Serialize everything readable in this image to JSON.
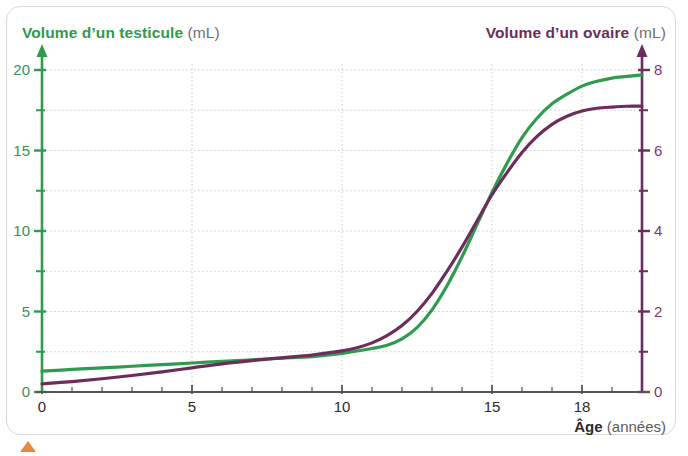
{
  "figure": {
    "frame_color": "#d9d9d9",
    "background": "#ffffff",
    "marker_color": "#e8883a",
    "marker_name": "orange-triangle-marker"
  },
  "titles": {
    "left_axis_main": "Volume d’un testicule",
    "left_axis_unit": "(mL)",
    "right_axis_main": "Volume d’un ovaire",
    "right_axis_unit": "(mL)",
    "x_axis_main": "Âge",
    "x_axis_unit": "(années)"
  },
  "ticks": {
    "left": [
      "20",
      "15",
      "10",
      "5",
      "0"
    ],
    "right": [
      "8",
      "6",
      "4",
      "2",
      "0"
    ],
    "x": [
      "0",
      "5",
      "10",
      "15",
      "18"
    ]
  },
  "chart_data": {
    "type": "line",
    "title": "",
    "subtitle": "",
    "xlabel": "Âge (années)",
    "ylabel": "Volume d’un testicule (mL)",
    "y2label": "Volume d’un ovaire (mL)",
    "xlim": [
      0,
      20
    ],
    "ylim": [
      0,
      20
    ],
    "y2lim": [
      0,
      8
    ],
    "xticks": [
      0,
      5,
      10,
      15,
      18
    ],
    "xticks_minor_step": 1,
    "yticks": [
      0,
      5,
      10,
      15,
      20
    ],
    "yticks_minor_step": 2.5,
    "y2ticks": [
      0,
      2,
      4,
      6,
      8
    ],
    "y2ticks_minor_step": 1,
    "grid": true,
    "grid_style": "dotted",
    "legend": "axis-colored-titles",
    "legend_position": "none",
    "series": [
      {
        "name": "Volume d’un testicule",
        "axis": "left",
        "unit": "mL",
        "color": "#2e9b4e",
        "x": [
          0,
          1,
          2,
          3,
          4,
          5,
          6,
          7,
          8,
          9,
          10,
          11,
          11.5,
          12,
          12.5,
          13,
          13.5,
          14,
          14.5,
          15,
          15.5,
          16,
          16.5,
          17,
          17.5,
          18,
          18.5,
          19,
          19.5,
          20
        ],
        "values": [
          1.3,
          1.4,
          1.5,
          1.6,
          1.7,
          1.8,
          1.9,
          2.0,
          2.1,
          2.2,
          2.4,
          2.7,
          2.9,
          3.3,
          4.0,
          5.1,
          6.6,
          8.4,
          10.4,
          12.4,
          14.2,
          15.8,
          17.0,
          17.9,
          18.5,
          19.0,
          19.3,
          19.5,
          19.6,
          19.7
        ]
      },
      {
        "name": "Volume d’un ovaire",
        "axis": "right",
        "unit": "mL",
        "color": "#6b2d5c",
        "x": [
          0,
          1,
          2,
          3,
          4,
          5,
          6,
          7,
          8,
          9,
          10,
          10.5,
          11,
          11.5,
          12,
          12.5,
          13,
          13.5,
          14,
          14.5,
          15,
          15.5,
          16,
          16.5,
          17,
          17.5,
          18,
          18.5,
          19,
          19.5,
          20
        ],
        "values": [
          0.2,
          0.26,
          0.33,
          0.41,
          0.5,
          0.6,
          0.7,
          0.78,
          0.85,
          0.92,
          1.02,
          1.1,
          1.22,
          1.4,
          1.65,
          2.0,
          2.45,
          3.0,
          3.6,
          4.25,
          4.9,
          5.45,
          5.95,
          6.35,
          6.65,
          6.85,
          6.98,
          7.05,
          7.08,
          7.1,
          7.1
        ]
      }
    ],
    "annotations": [
      "Les deux courbes se croisent vers 15 ans."
    ]
  }
}
